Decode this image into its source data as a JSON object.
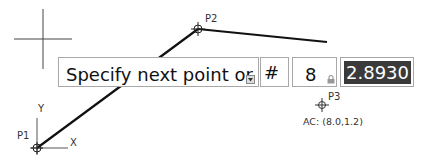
{
  "points": {
    "p1": {
      "label": "P1"
    },
    "p2": {
      "label": "P2"
    },
    "p3": {
      "label": "P3"
    }
  },
  "ucs": {
    "x_label": "X",
    "y_label": "Y"
  },
  "dynamic_input": {
    "prompt": "Specify next point or",
    "hash": "#",
    "distance": "8",
    "angle_value": "2.8930"
  },
  "coords_readout": "AC: (8.0,1.2)"
}
